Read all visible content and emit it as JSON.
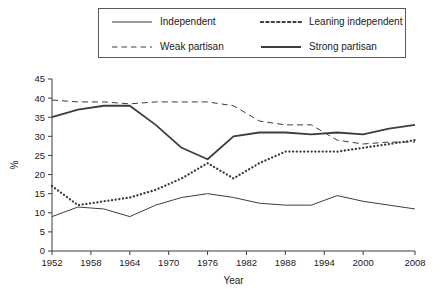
{
  "chart_data": {
    "type": "line",
    "title": "",
    "xlabel": "Year",
    "ylabel": "%",
    "xlim": [
      1952,
      2008
    ],
    "ylim": [
      0,
      45
    ],
    "grid": false,
    "legend_position": "top",
    "x_tick_labels": [
      "1952",
      "1958",
      "1964",
      "1970",
      "1976",
      "1982",
      "1988",
      "1994",
      "2000",
      "2008"
    ],
    "x_ticks": [
      1952,
      1958,
      1964,
      1970,
      1976,
      1982,
      1988,
      1994,
      2000,
      2008
    ],
    "y_tick_labels": [
      "0",
      "5",
      "10",
      "15",
      "20",
      "25",
      "30",
      "35",
      "40",
      "45"
    ],
    "y_ticks": [
      0,
      5,
      10,
      15,
      20,
      25,
      30,
      35,
      40,
      45
    ],
    "x": [
      1952,
      1956,
      1960,
      1964,
      1968,
      1972,
      1976,
      1980,
      1984,
      1988,
      1992,
      1996,
      2000,
      2004,
      2008
    ],
    "series": [
      {
        "name": "Independent",
        "style": "solid-thin",
        "color": "#3d3d3d",
        "values": [
          9,
          11.5,
          11,
          9,
          12,
          14,
          15,
          14,
          12.5,
          12,
          12,
          14.5,
          13,
          12,
          11
        ]
      },
      {
        "name": "Leaning independent",
        "style": "dotted",
        "color": "#3d3d3d",
        "values": [
          17,
          12,
          13,
          14,
          16,
          19,
          23,
          19,
          23,
          26,
          26,
          26,
          27,
          28,
          29
        ]
      },
      {
        "name": "Weak partisan",
        "style": "dashed",
        "color": "#3d3d3d",
        "values": [
          39.5,
          39,
          39,
          38.5,
          39,
          39,
          39,
          38,
          34,
          33,
          33,
          29,
          28,
          28.5,
          28.5
        ]
      },
      {
        "name": "Strong partisan",
        "style": "solid-thick",
        "color": "#3d3d3d",
        "values": [
          35,
          37,
          38,
          38,
          33,
          27,
          24,
          30,
          31,
          31,
          30.5,
          31,
          30.5,
          32,
          33
        ]
      }
    ]
  },
  "legend": {
    "entries": [
      {
        "label": "Independent",
        "style": "solid-thin"
      },
      {
        "label": "Leaning independent",
        "style": "dotted"
      },
      {
        "label": "Weak partisan",
        "style": "dashed"
      },
      {
        "label": "Strong partisan",
        "style": "solid-thick"
      }
    ]
  }
}
